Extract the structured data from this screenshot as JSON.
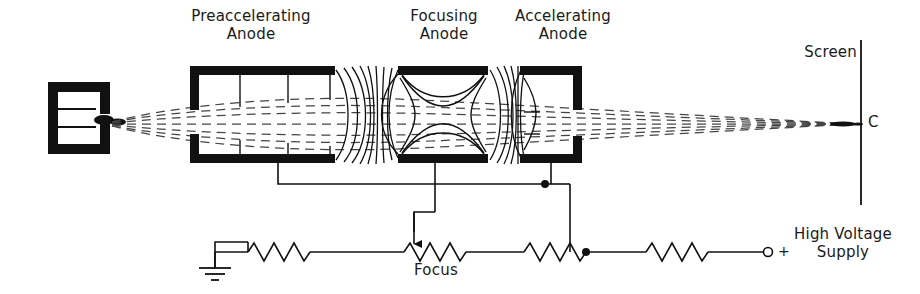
{
  "figure": {
    "ink_color": "#111111",
    "background": "#ffffff"
  },
  "labels": {
    "preaccelerating_anode": "Preaccelerating\nAnode",
    "focusing_anode": "Focusing\nAnode",
    "accelerating_anode": "Accelerating\nAnode",
    "screen": "Screen",
    "spot": "C",
    "focus": "Focus",
    "high_voltage_supply": "High Voltage\nSupply",
    "plus_terminal": "+"
  },
  "components": {
    "cathode_assembly": "cathode-grid-bracket",
    "electrodes": [
      {
        "name": "preaccelerating-anode",
        "x": 190,
        "y": 66,
        "w": 145,
        "h": 97
      },
      {
        "name": "focusing-anode",
        "x": 398,
        "y": 66,
        "w": 90,
        "h": 97
      },
      {
        "name": "accelerating-anode",
        "x": 520,
        "y": 66,
        "w": 62,
        "h": 97
      }
    ],
    "screen_line": {
      "x": 861,
      "y_top": 40,
      "y_bottom": 205
    },
    "beam_axis_y": 124,
    "ground_symbol": "earth-ground",
    "resistors": [
      {
        "name": "resistor-1",
        "x1": 248,
        "x2": 310,
        "y": 252
      },
      {
        "name": "focus-potentiometer",
        "x1": 404,
        "x2": 466,
        "y": 252
      },
      {
        "name": "resistor-3",
        "x1": 524,
        "x2": 586,
        "y": 252
      },
      {
        "name": "resistor-4",
        "x1": 646,
        "x2": 708,
        "y": 252
      }
    ],
    "junction_nodes": [
      {
        "name": "accel-bus-node",
        "x": 545,
        "y": 184
      },
      {
        "name": "divider-node",
        "x": 586,
        "y": 252
      }
    ],
    "supply_terminal": {
      "name": "positive-terminal",
      "x": 764,
      "y": 252
    }
  }
}
